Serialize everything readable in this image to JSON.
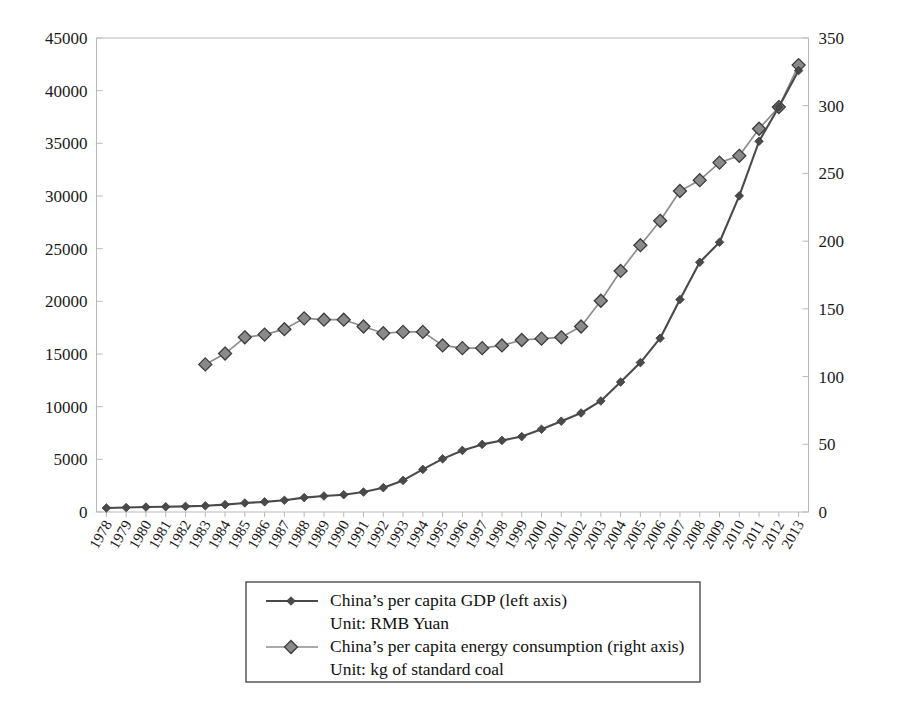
{
  "chart_data": {
    "type": "line",
    "title": "",
    "xlabel": "",
    "ylabel": "",
    "grid": false,
    "legend_position": "bottom-center",
    "x": [
      1978,
      1979,
      1980,
      1981,
      1982,
      1983,
      1984,
      1985,
      1986,
      1987,
      1988,
      1989,
      1990,
      1991,
      1992,
      1993,
      1994,
      1995,
      1996,
      1997,
      1998,
      1999,
      2000,
      2001,
      2002,
      2003,
      2004,
      2005,
      2006,
      2007,
      2008,
      2009,
      2010,
      2011,
      2012,
      2013
    ],
    "xtick_labels": [
      "1978",
      "1979",
      "1980",
      "1981",
      "1982",
      "1983",
      "1984",
      "1985",
      "1986",
      "1987",
      "1988",
      "1989",
      "1990",
      "1991",
      "1992",
      "1993",
      "1994",
      "1995",
      "1996",
      "1997",
      "1998",
      "1999",
      "2000",
      "2001",
      "2002",
      "2003",
      "2004",
      "2005",
      "2006",
      "2007",
      "2008",
      "2009",
      "2010",
      "2011",
      "2012",
      "2013"
    ],
    "left_axis": {
      "label": "China's per capita GDP (left axis) Unit: RMB Yuan",
      "ylim": [
        0,
        45000
      ],
      "ytick_labels": [
        "0",
        "5000",
        "10000",
        "15000",
        "20000",
        "25000",
        "30000",
        "35000",
        "40000",
        "45000"
      ],
      "ytick_values": [
        0,
        5000,
        10000,
        15000,
        20000,
        25000,
        30000,
        35000,
        40000,
        45000
      ]
    },
    "right_axis": {
      "label": "China's per capita energy consumption (right axis) Unit: kg of standard coal",
      "ylim": [
        0,
        350
      ],
      "ytick_labels": [
        "0",
        "50",
        "100",
        "150",
        "200",
        "250",
        "300",
        "350"
      ],
      "ytick_values": [
        0,
        50,
        100,
        150,
        200,
        250,
        300,
        350
      ]
    },
    "series": [
      {
        "name": "China's per capita GDP (left axis)",
        "unit": "RMB Yuan",
        "axis": "left",
        "marker": "diamond-filled",
        "color": "#4a4a4a",
        "values": [
          385,
          423,
          468,
          497,
          533,
          588,
          700,
          858,
          963,
          1112,
          1366,
          1519,
          1644,
          1893,
          2311,
          2998,
          4044,
          5046,
          5846,
          6420,
          6796,
          7159,
          7858,
          8622,
          9398,
          10542,
          12336,
          14185,
          16500,
          20169,
          23708,
          25608,
          30015,
          35198,
          38459,
          41908
        ]
      },
      {
        "name": "China's per capita energy consumption (right axis)",
        "unit": "kg of standard coal",
        "axis": "right",
        "marker": "diamond-outlined",
        "color": "#8a8a8a",
        "values": [
          null,
          null,
          null,
          null,
          null,
          109,
          117,
          129,
          131,
          135,
          143,
          142,
          142,
          137,
          132,
          133,
          133,
          123,
          121,
          121,
          123,
          127,
          128,
          129,
          137,
          156,
          178,
          197,
          215,
          237,
          245,
          258,
          263,
          283,
          299,
          330
        ]
      }
    ],
    "crossover_note": "",
    "legend_entries": [
      {
        "label_line1": "China’s per capita GDP (left axis)",
        "label_line2": "Unit: RMB Yuan",
        "marker": "diamond-filled"
      },
      {
        "label_line1": "China’s per capita energy consumption (right axis)",
        "label_line2": "Unit: kg of standard coal",
        "marker": "diamond-outlined"
      }
    ]
  }
}
